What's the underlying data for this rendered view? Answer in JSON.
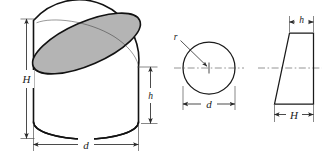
{
  "figure": {
    "background_color": "#ffffff",
    "outline_color": "#121212",
    "body_fill_color": "#9e9e9e",
    "top_face_fill_color": "#b4b4b4",
    "dimension_line_color": "#2a2a2a",
    "center_line_color": "#7a7a7a"
  },
  "pictorial_view": {
    "name": "oblique-cut-cylinder",
    "dimensions": {
      "height_major_label": "H",
      "height_minor_label": "h",
      "diameter_label": "d"
    }
  },
  "top_view": {
    "name": "circular-top-view",
    "labels": {
      "radius_label": "r",
      "diameter_label": "d"
    }
  },
  "side_view": {
    "name": "trapezoid-side-view",
    "labels": {
      "short_side_label": "h",
      "long_side_label": "H"
    }
  },
  "all_symbols": [
    "H",
    "h",
    "d",
    "r",
    "d",
    "h",
    "H"
  ]
}
